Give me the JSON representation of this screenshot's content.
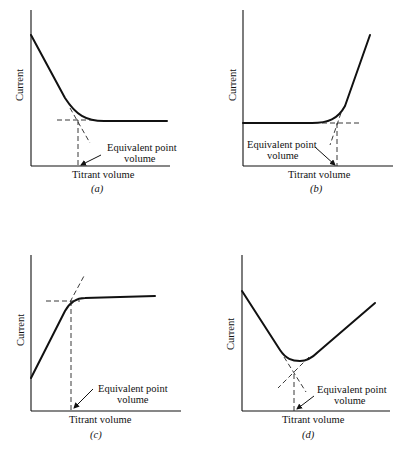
{
  "figure": {
    "panels": [
      {
        "id": "a",
        "caption": "(a)",
        "ylabel": "Current",
        "xlabel": "Titrant volume",
        "annotation_line1": "Equivalent point",
        "annotation_line2": "volume",
        "shape": "decreasing then flat"
      },
      {
        "id": "b",
        "caption": "(b)",
        "ylabel": "Current",
        "xlabel": "Titrant volume",
        "annotation_line1": "Equivalent point",
        "annotation_line2": "volume",
        "shape": "flat then increasing"
      },
      {
        "id": "c",
        "caption": "(c)",
        "ylabel": "Current",
        "xlabel": "Titrant volume",
        "annotation_line1": "Equivalent point",
        "annotation_line2": "volume",
        "shape": "increasing then flat"
      },
      {
        "id": "d",
        "caption": "(d)",
        "ylabel": "Current",
        "xlabel": "Titrant volume",
        "annotation_line1": "Equivalent point",
        "annotation_line2": "volume",
        "shape": "decreasing then increasing (V-shape)"
      }
    ]
  }
}
